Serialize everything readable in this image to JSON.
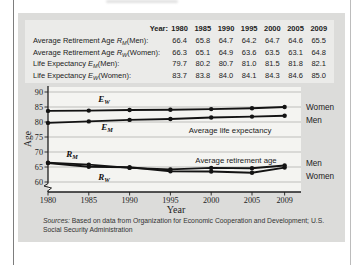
{
  "figure": {
    "table": {
      "header": {
        "label": "Year:",
        "values": [
          "1980",
          "1985",
          "1990",
          "1995",
          "2000",
          "2005",
          "2009"
        ]
      },
      "rows": [
        {
          "prefix": "Average Retirement Age ",
          "symbol": "R",
          "subscript": "M",
          "suffix": "(Men):",
          "values": [
            "66.4",
            "65.8",
            "64.7",
            "64.2",
            "64.7",
            "64.6",
            "65.5"
          ]
        },
        {
          "prefix": "Average Retirement Age ",
          "symbol": "R",
          "subscript": "W",
          "suffix": "(Women):",
          "values": [
            "66.3",
            "65.1",
            "64.9",
            "63.6",
            "63.5",
            "63.1",
            "64.8"
          ]
        },
        {
          "prefix": "Life Expectancy ",
          "symbol": "E",
          "subscript": "M",
          "suffix": "(Men):",
          "values": [
            "79.7",
            "80.2",
            "80.7",
            "81.0",
            "81.5",
            "81.8",
            "82.1"
          ]
        },
        {
          "prefix": "Life Expectancy ",
          "symbol": "E",
          "subscript": "W",
          "suffix": "(Women):",
          "values": [
            "83.7",
            "83.8",
            "84.0",
            "84.1",
            "84.3",
            "84.6",
            "85.0"
          ]
        }
      ]
    },
    "sources": {
      "label": "Sources:",
      "text": "Based on data from Organization for Economic Cooperation and Development; U.S. Social Security Administration"
    }
  },
  "chart_data": {
    "type": "line",
    "x": [
      1980,
      1985,
      1990,
      1995,
      2000,
      2005,
      2009
    ],
    "xlabel": "Year",
    "ylabel": "Age",
    "yticks": [
      90,
      85,
      80,
      75,
      70,
      65,
      60
    ],
    "ylim": [
      60,
      90
    ],
    "axis_break_below": 60,
    "grid": "horizontal",
    "legend_position": "right",
    "series": [
      {
        "name": "Life expectancy (Women)",
        "symbol": "E",
        "subscript": "W",
        "right_label": "Women",
        "values": [
          83.7,
          83.8,
          84.0,
          84.1,
          84.3,
          84.6,
          85.0
        ]
      },
      {
        "name": "Life expectancy (Men)",
        "symbol": "E",
        "subscript": "M",
        "right_label": "Men",
        "values": [
          79.7,
          80.2,
          80.7,
          81.0,
          81.5,
          81.8,
          82.1
        ]
      },
      {
        "name": "Average retirement age (Men)",
        "symbol": "R",
        "subscript": "M",
        "right_label": "Men",
        "values": [
          66.4,
          65.8,
          64.7,
          64.2,
          64.7,
          64.6,
          65.5
        ]
      },
      {
        "name": "Average retirement age (Women)",
        "symbol": "R",
        "subscript": "W",
        "right_label": "Women",
        "values": [
          66.3,
          65.1,
          64.9,
          63.6,
          63.5,
          63.1,
          64.8
        ]
      }
    ],
    "annotations": [
      "Average life expectancy",
      "Average retirement age"
    ],
    "colors": {
      "line": "#131313",
      "axis": "#1e1e1e",
      "grid": "#a6a6a4",
      "panel": "#dcdcda",
      "table_bg": "#ebebe9",
      "plot_bg": "#f4f4f1",
      "text": "#222222"
    }
  }
}
